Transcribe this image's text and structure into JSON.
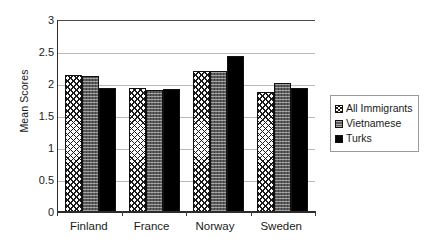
{
  "chart_data": {
    "type": "bar",
    "title": "",
    "xlabel": "",
    "ylabel": "Mean Scores",
    "categories": [
      "Finland",
      "France",
      "Norway",
      "Sweden"
    ],
    "series": [
      {
        "name": "All Immigrants",
        "values": [
          2.14,
          1.94,
          2.21,
          1.88
        ]
      },
      {
        "name": "Vietnamese",
        "values": [
          2.12,
          1.91,
          2.2,
          2.02
        ]
      },
      {
        "name": "Turks",
        "values": [
          1.93,
          1.92,
          2.43,
          1.93
        ]
      }
    ],
    "ylim": [
      0,
      3
    ],
    "yticks": [
      "0",
      "0.5",
      "1",
      "1.5",
      "2",
      "2.5",
      "3"
    ],
    "ytick_values": [
      0,
      0.5,
      1,
      1.5,
      2,
      2.5,
      3
    ],
    "grid": true,
    "legend_position": "right",
    "colors": {
      "series_0_fill": "#ffffff",
      "series_0_pattern": "#1a1a1a",
      "series_1_fill": "#5d5d5d",
      "series_2_fill": "#000000",
      "gridline": "#b9b9b9",
      "axis": "#2b2b2b",
      "background": "#ffffff"
    }
  },
  "legend": {
    "items": [
      {
        "label": "All Immigrants",
        "swatch": "crosshatch-swatch"
      },
      {
        "label": "Vietnamese",
        "swatch": "gray-texture-swatch"
      },
      {
        "label": "Turks",
        "swatch": "solid-black-swatch"
      }
    ]
  }
}
